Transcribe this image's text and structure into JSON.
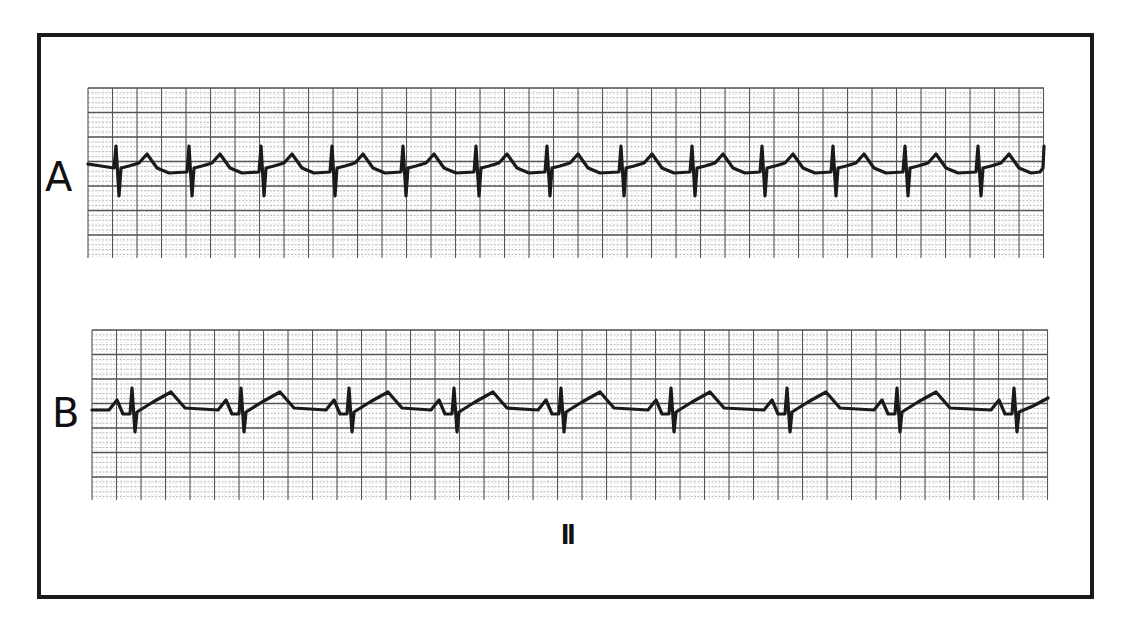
{
  "figure": {
    "strips": [
      {
        "label": "A",
        "grid": {
          "x": 88,
          "y": 88,
          "width": 956,
          "height": 170
        },
        "baseline_y": 174,
        "complex_type": "qrs_then_t",
        "qrs_x": [
          117,
          190,
          262,
          333,
          404,
          477,
          548,
          622,
          693,
          763,
          834,
          906,
          979,
          1043
        ]
      },
      {
        "label": "B",
        "grid": {
          "x": 92,
          "y": 330,
          "width": 956,
          "height": 170
        },
        "baseline_y": 410,
        "complex_type": "p_qrs_t",
        "qrs_x": [
          133,
          242,
          350,
          455,
          562,
          672,
          788,
          898,
          1015
        ]
      }
    ],
    "lead": "II",
    "colors": {
      "ink": "#1a1a1a",
      "grid_major": "#555555",
      "grid_minor": "#9a9a9a",
      "background": "#ffffff"
    }
  }
}
